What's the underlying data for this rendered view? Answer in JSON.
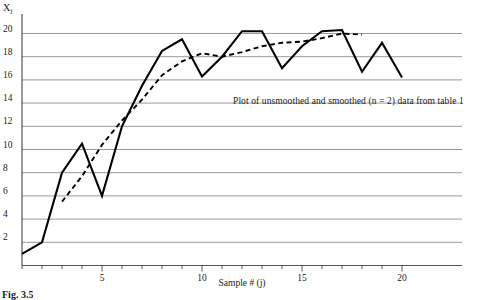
{
  "figure": {
    "caption": "Fig. 3.5",
    "annotation": "Plot of unsmoothed and smoothed (n = 2) data from table 1"
  },
  "axes": {
    "y_axis_label": "X",
    "y_axis_label_sub": "j",
    "x_axis_title": "Sample # (j)",
    "y_ticks": [
      "2",
      "4",
      "6",
      "8",
      "10",
      "12",
      "14",
      "16",
      "18",
      "20"
    ],
    "x_ticks": [
      "5",
      "10",
      "15",
      "20"
    ]
  },
  "chart_data": {
    "type": "line",
    "title": "",
    "subtitle": "",
    "annotations": [
      "Plot of unsmoothed and smoothed (n = 2) data from table 1"
    ],
    "xlabel": "Sample # (j)",
    "ylabel": "Xj",
    "xlim": [
      1,
      20
    ],
    "ylim": [
      0,
      21
    ],
    "xticks": [
      5,
      10,
      15,
      20
    ],
    "yticks": [
      2,
      4,
      6,
      8,
      10,
      12,
      14,
      16,
      18,
      20
    ],
    "grid": "horizontal",
    "legend": "none",
    "x": [
      1,
      2,
      3,
      4,
      5,
      6,
      7,
      8,
      9,
      10,
      11,
      12,
      13,
      14,
      15,
      16,
      17,
      18,
      19,
      20
    ],
    "series": [
      {
        "name": "unsmoothed",
        "style": "solid",
        "color": "#000000",
        "values": [
          1.0,
          2.0,
          8.0,
          10.5,
          6.0,
          12.0,
          15.5,
          18.5,
          19.5,
          16.3,
          18.0,
          20.2,
          20.2,
          17.0,
          18.9,
          20.2,
          20.3,
          16.7,
          19.2,
          16.2
        ]
      },
      {
        "name": "smoothed (n = 2)",
        "style": "dashed",
        "color": "#000000",
        "values": [
          null,
          null,
          5.5,
          7.7,
          10.4,
          12.5,
          14.3,
          16.4,
          17.6,
          18.3,
          18.0,
          18.4,
          18.9,
          19.2,
          19.3,
          19.6,
          20.0,
          19.9,
          null,
          null
        ]
      }
    ]
  }
}
